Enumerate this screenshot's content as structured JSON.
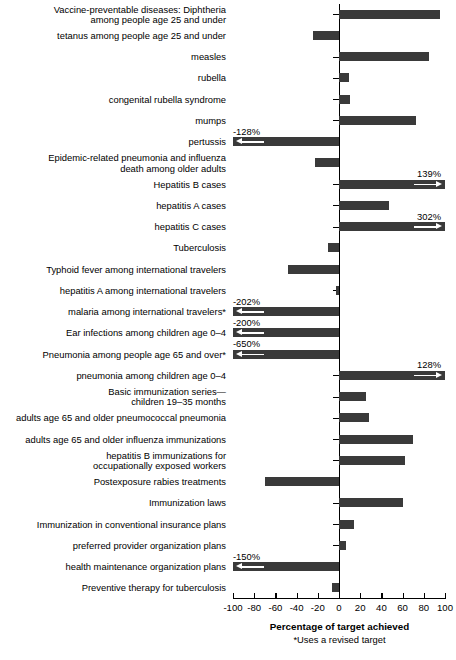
{
  "chart_data": {
    "type": "bar",
    "orientation": "horizontal",
    "title": "",
    "xlabel": "Percentage of target achieved",
    "ylabel": "",
    "xlim": [
      -100,
      100
    ],
    "xticks": [
      -100,
      -80,
      -60,
      -40,
      -20,
      0,
      20,
      40,
      60,
      80,
      100
    ],
    "xtick_labels": [
      "-100",
      "-80",
      "-60",
      "-40",
      "-20",
      "0",
      "20",
      "40",
      "60",
      "80",
      "100"
    ],
    "grid": false,
    "legend": null,
    "footnote": "*Uses a revised target",
    "bar_color": "#3a3a3a",
    "axis_color": "#000000",
    "categories": [
      "Vaccine-preventable diseases: Diphtheria\namong people age 25 and under",
      "tetanus among people age 25 and under",
      "measles",
      "rubella",
      "congenital rubella syndrome",
      "mumps",
      "pertussis",
      "Epidemic-related pneumonia and influenza\ndeath among older adults",
      "Hepatitis B cases",
      "hepatitis A cases",
      "hepatitis C cases",
      "Tuberculosis",
      "Typhoid fever among international travelers",
      "hepatitis A among international travelers",
      "malaria among international travelers*",
      "Ear infections among children age 0–4",
      "Pneumonia among people age 65 and over*",
      "pneumonia among children age 0–4",
      "Basic immunization series—\nchildren 19–35 months",
      "adults age 65 and older pneumococcal pneumonia",
      "adults age 65 and older influenza immunizations",
      "hepatitis B immunizations for\noccupationally exposed workers",
      "Postexposure rabies treatments",
      "Immunization laws",
      "Immunization in conventional insurance plans",
      "preferred provider organization plans",
      "health maintenance organization plans",
      "Preventive therapy for tuberculosis"
    ],
    "values": [
      95,
      -25,
      85,
      9,
      10,
      73,
      -128,
      -23,
      139,
      47,
      302,
      -10,
      -48,
      -3,
      -202,
      -200,
      -650,
      128,
      25,
      28,
      70,
      62,
      -70,
      60,
      14,
      7,
      -150,
      -7
    ],
    "annotations": [
      {
        "index": 6,
        "label": "-128%",
        "offscale": true,
        "direction": "left"
      },
      {
        "index": 8,
        "label": "139%",
        "offscale": true,
        "direction": "right"
      },
      {
        "index": 10,
        "label": "302%",
        "offscale": true,
        "direction": "right"
      },
      {
        "index": 14,
        "label": "-202%",
        "offscale": true,
        "direction": "left"
      },
      {
        "index": 15,
        "label": "-200%",
        "offscale": true,
        "direction": "left"
      },
      {
        "index": 16,
        "label": "-650%",
        "offscale": true,
        "direction": "left"
      },
      {
        "index": 17,
        "label": "128%",
        "offscale": true,
        "direction": "right"
      },
      {
        "index": 26,
        "label": "-150%",
        "offscale": true,
        "direction": "left"
      }
    ]
  },
  "axis": {
    "title": "Percentage of target achieved",
    "footnote": "*Uses a revised target"
  }
}
